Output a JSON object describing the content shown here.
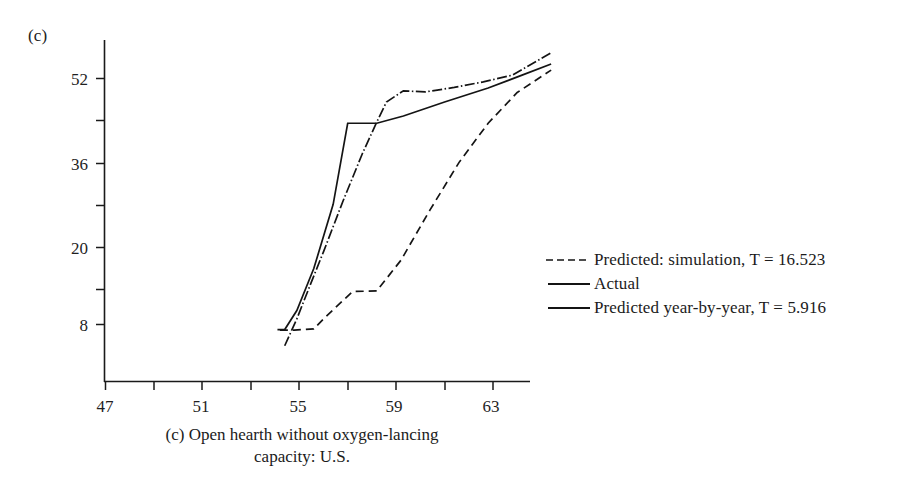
{
  "panel": {
    "tag": "(c)",
    "caption_line1": "(c) Open hearth without oxygen-lancing",
    "caption_line2": "capacity: U.S."
  },
  "legend": {
    "items": [
      {
        "label": "Predicted: simulation, T = 16.523",
        "style": "dashed"
      },
      {
        "label": "Actual",
        "style": "solid"
      },
      {
        "label": "Predicted year-by-year, T = 5.916",
        "style": "solid"
      }
    ]
  },
  "chart_data": {
    "type": "line",
    "title": "(c) Open hearth without oxygen-lancing capacity: U.S.",
    "xlabel": "",
    "ylabel": "",
    "xlim": [
      47,
      65.5
    ],
    "ylim": [
      4,
      58
    ],
    "grid": false,
    "legend_position": "right",
    "x_ticks_major": [
      47,
      51,
      55,
      59,
      63
    ],
    "x_ticks_minor": [
      49,
      53,
      57,
      61,
      65
    ],
    "x_tick_labels": [
      "47",
      "51",
      "55",
      "59",
      "63"
    ],
    "y_ticks_major": [
      8,
      20,
      36,
      52
    ],
    "y_ticks_minor": [
      14,
      28,
      44
    ],
    "y_tick_labels": [
      "8",
      "20",
      "36",
      "52"
    ],
    "series": [
      {
        "name": "Predicted: simulation, T = 16.523",
        "style": "dashed",
        "x": [
          54.2,
          54.8,
          55.6,
          56.0,
          57.2,
          57.2,
          58.2,
          59.2,
          60.4,
          61.6,
          62.8,
          64.0,
          65.4
        ],
        "y": [
          7.0,
          7.0,
          7.2,
          9.0,
          13.9,
          13.9,
          14.0,
          19.5,
          28.5,
          37.0,
          44.0,
          49.5,
          53.5
        ]
      },
      {
        "name": "Actual",
        "style": "solid",
        "x": [
          54.1,
          54.4,
          54.9,
          55.6,
          56.4,
          57.0,
          57.0,
          58.2,
          59.3,
          61.0,
          62.8,
          64.2,
          65.4
        ],
        "y": [
          7.1,
          7.1,
          10.5,
          18.0,
          29.5,
          44.0,
          44.0,
          44.0,
          45.3,
          47.8,
          50.3,
          52.6,
          54.6
        ]
      },
      {
        "name": "Predicted year-by-year, T = 5.916",
        "style": "dashdot",
        "x": [
          54.4,
          54.9,
          55.4,
          56.0,
          56.8,
          57.6,
          58.2,
          58.6,
          59.3,
          60.2,
          61.4,
          62.6,
          63.8,
          65.4
        ],
        "y": [
          4.2,
          9.0,
          14.5,
          21.0,
          30.0,
          38.5,
          44.2,
          47.8,
          49.8,
          49.6,
          50.4,
          51.4,
          52.6,
          56.6
        ]
      }
    ],
    "annotations": [
      {
        "text": "(c)",
        "position": "top-left"
      }
    ]
  }
}
